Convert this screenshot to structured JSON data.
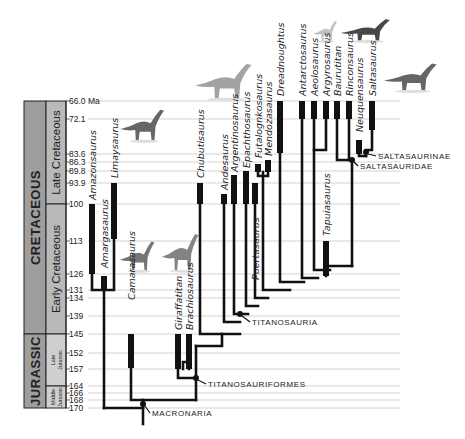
{
  "figure": {
    "unit_label": "Ma",
    "ticks": [
      {
        "label": "66.0 Ma",
        "y": 101
      },
      {
        "label": "72.1",
        "y": 119
      },
      {
        "label": "83.6",
        "y": 154
      },
      {
        "label": "86.3",
        "y": 162
      },
      {
        "label": "89.8",
        "y": 171
      },
      {
        "label": "93.9",
        "y": 183
      },
      {
        "label": "100",
        "y": 204
      },
      {
        "label": "113",
        "y": 241
      },
      {
        "label": "126",
        "y": 274
      },
      {
        "label": "131",
        "y": 290
      },
      {
        "label": "134",
        "y": 298
      },
      {
        "label": "139",
        "y": 316
      },
      {
        "label": "145",
        "y": 334
      },
      {
        "label": "152",
        "y": 353
      },
      {
        "label": "157",
        "y": 369
      },
      {
        "label": "164",
        "y": 386
      },
      {
        "label": "166",
        "y": 393
      },
      {
        "label": "168",
        "y": 400
      },
      {
        "label": "170",
        "y": 408
      }
    ],
    "periods": [
      {
        "label": "CRETACEOUS",
        "y0": 101,
        "y1": 334,
        "color": "#9e9e9e"
      },
      {
        "label": "JURASSIC",
        "y0": 334,
        "y1": 408,
        "color": "#9e9e9e"
      }
    ],
    "epochs": [
      {
        "label": "Late Cretaceous",
        "y0": 101,
        "y1": 204,
        "color": "#b9b9b9",
        "size": "large"
      },
      {
        "label": "Early Cretaceous",
        "y0": 204,
        "y1": 334,
        "color": "#b9b9b9",
        "size": "large"
      },
      {
        "label": "Late Jurassic",
        "y0": 334,
        "y1": 386,
        "color": "#cfcfcf",
        "size": "small"
      },
      {
        "label": "Middle Jurassic",
        "y0": 386,
        "y1": 408,
        "color": "#cfcfcf",
        "size": "small"
      }
    ],
    "taxa": [
      {
        "name": "Amazonsaurus",
        "x": 92,
        "bar_top": 204,
        "bar_bottom": 274,
        "label_y": 200
      },
      {
        "name": "Amargasaurus",
        "x": 104,
        "bar_top": 276,
        "bar_bottom": 290,
        "label_y": 268
      },
      {
        "name": "Limaysaurus",
        "x": 114,
        "bar_top": 183,
        "bar_bottom": 239,
        "label_y": 178
      },
      {
        "name": "Camarasaurus",
        "x": 131,
        "bar_top": 334,
        "bar_bottom": 368,
        "label_y": 300
      },
      {
        "name": "Giraffatitan",
        "x": 178,
        "bar_top": 334,
        "bar_bottom": 369,
        "label_y": 330
      },
      {
        "name": "Brachiosaurus",
        "x": 189,
        "bar_top": 334,
        "bar_bottom": 369,
        "label_y": 330
      },
      {
        "name": "Chubutisaurus",
        "x": 200,
        "bar_top": 183,
        "bar_bottom": 204,
        "label_y": 178
      },
      {
        "name": "Andesaurus",
        "x": 224,
        "bar_top": 194,
        "bar_bottom": 204,
        "label_y": 190
      },
      {
        "name": "Argentinosaurus",
        "x": 234,
        "bar_top": 175,
        "bar_bottom": 204,
        "label_y": 172
      },
      {
        "name": "Epachthosaurus",
        "x": 246,
        "bar_top": 171,
        "bar_bottom": 204,
        "label_y": 168
      },
      {
        "name": "Puertasaurus",
        "x": 255,
        "bar_top": 183,
        "bar_bottom": 204,
        "label_y": 280
      },
      {
        "name": "Futalognkosaurus",
        "x": 258,
        "bar_top": 164,
        "bar_bottom": 172,
        "label_y": 158
      },
      {
        "name": "Mendozasaurus",
        "x": 268,
        "bar_top": 160,
        "bar_bottom": 172,
        "label_y": 156
      },
      {
        "name": "Dreadnoughtus",
        "x": 280,
        "bar_top": 101,
        "bar_bottom": 153,
        "label_y": 96
      },
      {
        "name": "Antarctosaurus",
        "x": 302,
        "bar_top": 101,
        "bar_bottom": 119,
        "label_y": 96
      },
      {
        "name": "Aeolosaurus",
        "x": 314,
        "bar_top": 101,
        "bar_bottom": 119,
        "label_y": 96
      },
      {
        "name": "Argyrosaurus",
        "x": 326,
        "bar_top": 101,
        "bar_bottom": 119,
        "label_y": 96
      },
      {
        "name": "Baurutitan",
        "x": 337,
        "bar_top": 101,
        "bar_bottom": 119,
        "label_y": 96
      },
      {
        "name": "Rinconsaurus",
        "x": 349,
        "bar_top": 101,
        "bar_bottom": 119,
        "label_y": 96
      },
      {
        "name": "Tapuiasaurus",
        "x": 326,
        "bar_top": 241,
        "bar_bottom": 276,
        "label_y": 236
      },
      {
        "name": "Neuquensaurus",
        "x": 359,
        "bar_top": 140,
        "bar_bottom": 154,
        "label_y": 132
      },
      {
        "name": "Saltasaurus",
        "x": 372,
        "bar_top": 101,
        "bar_bottom": 130,
        "label_y": 96
      }
    ],
    "clades": [
      {
        "label": "SALTASAURINAE",
        "x": 378,
        "y": 159,
        "node_x": 366,
        "node_y": 152
      },
      {
        "label": "SALTASAURIDAE",
        "x": 360,
        "y": 169,
        "node_x": 352,
        "node_y": 160
      },
      {
        "label": "TITANOSAURIA",
        "x": 252,
        "y": 325,
        "node_x": 240,
        "node_y": 314
      },
      {
        "label": "TITANOSAURIFORMES",
        "x": 208,
        "y": 387,
        "node_x": 196,
        "node_y": 378
      },
      {
        "label": "MACRONARIA",
        "x": 152,
        "y": 416,
        "node_x": 143,
        "node_y": 404
      }
    ],
    "silhouettes": [
      {
        "name": "Limaysaurus-silhouette",
        "x": 118,
        "y": 108,
        "w": 48,
        "h": 34,
        "color": "#555"
      },
      {
        "name": "Camarasaurus-silhouette",
        "x": 118,
        "y": 240,
        "w": 38,
        "h": 32,
        "color": "#666"
      },
      {
        "name": "Brachiosaurus-silhouette",
        "x": 160,
        "y": 232,
        "w": 40,
        "h": 40,
        "color": "#777"
      },
      {
        "name": "Chubutisaurus-silhouette",
        "x": 192,
        "y": 62,
        "w": 62,
        "h": 38,
        "color": "#999"
      },
      {
        "name": "Argyrosaurus-silhouette",
        "x": 312,
        "y": 20,
        "w": 26,
        "h": 22,
        "color": "#bbb"
      },
      {
        "name": "Rinconsaurus-silhouette",
        "x": 338,
        "y": 18,
        "w": 54,
        "h": 24,
        "color": "#333"
      },
      {
        "name": "Saltasaurus-silhouette",
        "x": 381,
        "y": 62,
        "w": 58,
        "h": 30,
        "color": "#555"
      }
    ]
  }
}
